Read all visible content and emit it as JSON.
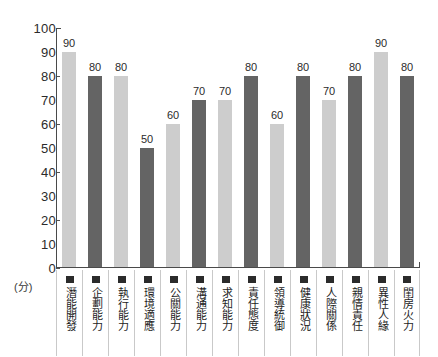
{
  "chart_data": {
    "type": "bar",
    "title": "",
    "xlabel": "",
    "ylabel": "(分)",
    "ylim": [
      0,
      100
    ],
    "ytick_step": 10,
    "ytick_labels": [
      "100",
      "90",
      "80",
      "70",
      "60",
      "50",
      "40",
      "30",
      "20",
      "10",
      "0"
    ],
    "major_ticks": [
      100,
      80,
      60,
      40,
      20,
      0
    ],
    "grid": false,
    "legend": "none",
    "categories": [
      "潛能開發",
      "企劃能力",
      "執行能力",
      "環境適應",
      "公關能力",
      "溝通能力",
      "求知能力",
      "責任態度",
      "領導統御",
      "健康狀況",
      "人際關係",
      "親情責任",
      "異性人緣",
      "閨房火力"
    ],
    "values": [
      90,
      80,
      80,
      50,
      60,
      70,
      70,
      80,
      60,
      80,
      70,
      80,
      90,
      80
    ],
    "bar_colors": [
      "#cdcdcd",
      "#646464",
      "#cdcdcd",
      "#646464",
      "#cdcdcd",
      "#646464",
      "#cdcdcd",
      "#646464",
      "#cdcdcd",
      "#646464",
      "#cdcdcd",
      "#646464",
      "#cdcdcd",
      "#646464"
    ],
    "colors": {
      "light_bar": "#cdcdcd",
      "dark_bar": "#646464",
      "axis": "#4a4a4a",
      "text": "#2b2b2b",
      "background": "#ffffff",
      "separator": "#c9c9c9"
    }
  }
}
